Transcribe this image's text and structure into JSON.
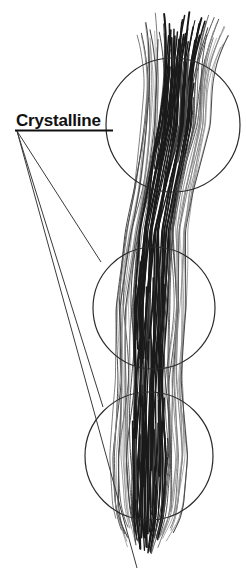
{
  "figure": {
    "background_color": "#ffffff",
    "width": 247,
    "height": 573
  },
  "annotation": {
    "label": "Crystalline",
    "label_style": "bold-underlined",
    "label_color": "#111111",
    "label_x": 16,
    "label_baseline_y": 126,
    "underline": {
      "x1": 15,
      "y1": 130.5,
      "x2": 113,
      "y2": 130.5,
      "color": "#111111",
      "thickness": 2
    },
    "leader_origin": {
      "x": 17,
      "y": 131
    },
    "leader_lines": [
      {
        "name": "leader-to-top-circle",
        "x1": 17,
        "y1": 131,
        "x2": 137,
        "y2": 568,
        "color": "#3a3a3a"
      },
      {
        "name": "leader-to-middle-circle",
        "x1": 17,
        "y1": 131,
        "x2": 101,
        "y2": 262,
        "color": "#3a3a3a"
      },
      {
        "name": "leader-to-bottom-circle",
        "x1": 17,
        "y1": 131,
        "x2": 103,
        "y2": 407,
        "color": "#3a3a3a"
      }
    ]
  },
  "callout_circles": [
    {
      "name": "callout-circle-top",
      "cx": 173,
      "cy": 125,
      "r": 67,
      "stroke": "#2b2b2b",
      "stroke_width": 1.2
    },
    {
      "name": "callout-circle-middle",
      "cx": 154,
      "cy": 308,
      "r": 61,
      "stroke": "#2b2b2b",
      "stroke_width": 1.2
    },
    {
      "name": "callout-circle-bottom",
      "cx": 149,
      "cy": 456,
      "r": 64,
      "stroke": "#2b2b2b",
      "stroke_width": 1.2
    }
  ],
  "fiber_bundle": {
    "name": "crystalline-fiber-bundle",
    "description": "Vertical bundle of wavy aligned fibrils, splayed at top, tapering at bottom, with dense dark crystalline cores inside each callout circle",
    "top_y": 12,
    "bottom_y": 556,
    "dark_color": "#1a1a1a",
    "mid_color": "#4a4a4a",
    "light_color": "#8a8a8a",
    "centerline": [
      {
        "y": 12,
        "x": 186,
        "half_width": 30
      },
      {
        "y": 60,
        "x": 180,
        "half_width": 32
      },
      {
        "y": 125,
        "x": 175,
        "half_width": 34
      },
      {
        "y": 190,
        "x": 163,
        "half_width": 30
      },
      {
        "y": 230,
        "x": 156,
        "half_width": 30
      },
      {
        "y": 308,
        "x": 152,
        "half_width": 36
      },
      {
        "y": 380,
        "x": 150,
        "half_width": 33
      },
      {
        "y": 456,
        "x": 150,
        "half_width": 38
      },
      {
        "y": 520,
        "x": 148,
        "half_width": 33
      },
      {
        "y": 556,
        "x": 146,
        "half_width": 22
      }
    ],
    "fiber_count": 64
  }
}
